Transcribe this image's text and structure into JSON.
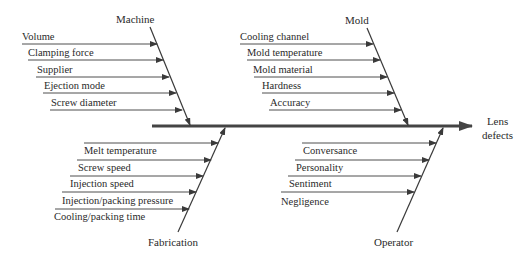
{
  "effect": {
    "line1": "Lens",
    "line2": "defects"
  },
  "categories": {
    "machine": {
      "label": "Machine",
      "causes": [
        "Volume",
        "Clamping force",
        "Supplier",
        "Ejection mode",
        "Screw diameter"
      ]
    },
    "mold": {
      "label": "Mold",
      "causes": [
        "Cooling channel",
        "Mold temperature",
        "Mold material",
        "Hardness",
        "Accuracy"
      ]
    },
    "fabrication": {
      "label": "Fabrication",
      "causes": [
        "Melt temperature",
        "Screw speed",
        "Injection speed",
        "Injection/packing pressure",
        "Cooling/packing time"
      ]
    },
    "operator": {
      "label": "Operator",
      "causes": [
        "Conversance",
        "Personality",
        "Sentiment",
        "Negligence"
      ]
    }
  },
  "colors": {
    "line": "#3a3a3a",
    "spine": "#444444",
    "text": "#2a2a2a"
  }
}
